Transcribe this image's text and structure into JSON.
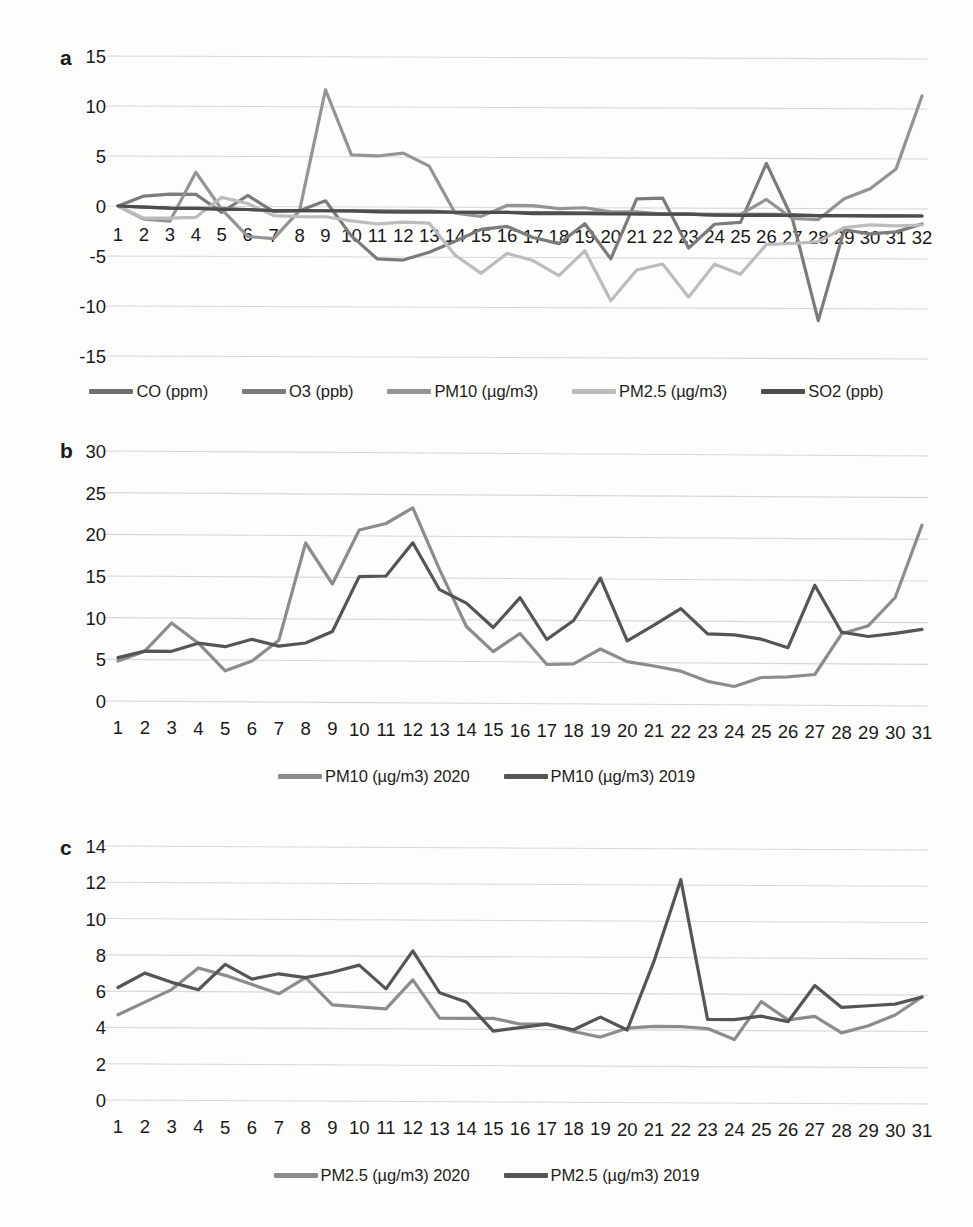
{
  "figure": {
    "panels": [
      "a",
      "b",
      "c"
    ],
    "background": "#fdfdfc"
  },
  "colors": {
    "co": "#6e6e6e",
    "o3": "#7b7b7b",
    "pm10": "#949494",
    "pm25": "#bcbcbc",
    "so2": "#4d4d4d",
    "series_2020": "#8c8c8c",
    "series_2019": "#555555",
    "grid": "#d8d8d8",
    "text": "#1d1d1d"
  },
  "panel_a": {
    "letter": "a",
    "ylabels": [
      "15",
      "10",
      "5",
      "0",
      "-5",
      "-10",
      "-15"
    ],
    "xlabels": [
      "1",
      "2",
      "3",
      "4",
      "5",
      "6",
      "7",
      "8",
      "9",
      "10",
      "11",
      "12",
      "13",
      "14",
      "15",
      "16",
      "17",
      "18",
      "19",
      "20",
      "21",
      "22",
      "23",
      "24",
      "25",
      "26",
      "27",
      "28",
      "29",
      "30",
      "31",
      "32"
    ],
    "legend": [
      {
        "label": "CO (ppm)",
        "color_key": "co"
      },
      {
        "label": "O3 (ppb)",
        "color_key": "o3"
      },
      {
        "label": "PM10 (µg/m3)",
        "color_key": "pm10"
      },
      {
        "label": "PM2.5 (µg/m3)",
        "color_key": "pm25"
      },
      {
        "label": "SO2 (ppb)",
        "color_key": "so2"
      }
    ]
  },
  "panel_b": {
    "letter": "b",
    "ylabels": [
      "30",
      "25",
      "20",
      "15",
      "10",
      "5",
      "0"
    ],
    "xlabels": [
      "1",
      "2",
      "3",
      "4",
      "5",
      "6",
      "7",
      "8",
      "9",
      "10",
      "11",
      "12",
      "13",
      "14",
      "15",
      "16",
      "17",
      "18",
      "19",
      "20",
      "21",
      "22",
      "23",
      "24",
      "25",
      "26",
      "27",
      "28",
      "29",
      "30",
      "31"
    ],
    "legend": [
      {
        "label": "PM10 (µg/m3) 2020",
        "color_key": "series_2020"
      },
      {
        "label": "PM10 (µg/m3) 2019",
        "color_key": "series_2019"
      }
    ]
  },
  "panel_c": {
    "letter": "c",
    "ylabels": [
      "14",
      "12",
      "10",
      "8",
      "6",
      "4",
      "2",
      "0"
    ],
    "xlabels": [
      "1",
      "2",
      "3",
      "4",
      "5",
      "6",
      "7",
      "8",
      "9",
      "10",
      "11",
      "12",
      "13",
      "14",
      "15",
      "16",
      "17",
      "18",
      "19",
      "20",
      "21",
      "22",
      "23",
      "24",
      "25",
      "26",
      "27",
      "28",
      "29",
      "30",
      "31"
    ],
    "legend": [
      {
        "label": "PM2.5 (µg/m3) 2020",
        "color_key": "series_2020"
      },
      {
        "label": "PM2.5 (µg/m3) 2019",
        "color_key": "series_2019"
      }
    ]
  },
  "chart_data": [
    {
      "panel": "a",
      "type": "line",
      "title": "",
      "xlabel": "",
      "ylabel": "",
      "ylim": [
        -15,
        15
      ],
      "yticks": [
        15,
        10,
        5,
        0,
        -5,
        -10,
        -15
      ],
      "grid": true,
      "legend_position": "bottom",
      "x": [
        1,
        2,
        3,
        4,
        5,
        6,
        7,
        8,
        9,
        10,
        11,
        12,
        13,
        14,
        15,
        16,
        17,
        18,
        19,
        20,
        21,
        22,
        23,
        24,
        25,
        26,
        27,
        28,
        29,
        30,
        31,
        32
      ],
      "series": [
        {
          "name": "CO (ppm)",
          "color": "#6e6e6e",
          "values": [
            0,
            -0.1,
            -0.2,
            -0.2,
            -0.2,
            -0.3,
            -0.4,
            -0.4,
            -0.4,
            -0.4,
            -0.4,
            -0.4,
            -0.4,
            -0.5,
            -0.5,
            -0.5,
            -0.5,
            -0.5,
            -0.5,
            -0.5,
            -0.6,
            -0.6,
            -0.6,
            -0.6,
            -0.6,
            -0.6,
            -0.6,
            -0.7,
            -0.7,
            -0.7,
            -0.7,
            -0.7
          ]
        },
        {
          "name": "O3 (ppb)",
          "color": "#7b7b7b",
          "values": [
            0,
            1.0,
            1.2,
            1.2,
            -0.6,
            1.1,
            -0.5,
            -0.4,
            0.6,
            -2.9,
            -5.2,
            -5.3,
            -4.5,
            -3.4,
            -2.2,
            -1.9,
            -3.0,
            -3.6,
            -1.6,
            -5.1,
            0.9,
            1.0,
            -4.0,
            -1.6,
            -1.4,
            4.5,
            -1.0,
            -11.2,
            -2.1,
            -2.5,
            -2.3,
            -1.5
          ]
        },
        {
          "name": "PM10 (µg/m3)",
          "color": "#949494",
          "values": [
            0,
            -1.3,
            -1.5,
            3.4,
            -0.3,
            -3.0,
            -3.2,
            -0.4,
            11.7,
            5.2,
            5.1,
            5.4,
            4.1,
            -0.6,
            -0.9,
            0.2,
            0.2,
            -0.1,
            0.0,
            -0.4,
            -0.4,
            -0.6,
            -0.6,
            -0.7,
            -0.6,
            0.9,
            -1.0,
            -1.1,
            1.0,
            2.0,
            4.0,
            11.3
          ]
        },
        {
          "name": "PM2.5 (µg/m3)",
          "color": "#bcbcbc",
          "values": [
            0,
            -1.2,
            -1.2,
            -1.1,
            0.9,
            0.3,
            -0.9,
            -1.0,
            -1.0,
            -1.4,
            -1.7,
            -1.5,
            -1.6,
            -4.8,
            -6.6,
            -4.6,
            -5.3,
            -6.8,
            -4.3,
            -9.3,
            -6.2,
            -5.6,
            -8.9,
            -5.6,
            -6.6,
            -3.6,
            -3.5,
            -3.3,
            -1.9,
            -1.6,
            -1.7,
            -1.6
          ]
        },
        {
          "name": "SO2 (ppb)",
          "color": "#4d4d4d",
          "values": [
            0,
            -0.1,
            -0.2,
            -0.2,
            -0.3,
            -0.3,
            -0.4,
            -0.4,
            -0.4,
            -0.4,
            -0.5,
            -0.5,
            -0.5,
            -0.5,
            -0.5,
            -0.5,
            -0.6,
            -0.6,
            -0.6,
            -0.6,
            -0.6,
            -0.6,
            -0.6,
            -0.7,
            -0.7,
            -0.7,
            -0.7,
            -0.7,
            -0.7,
            -0.7,
            -0.7,
            -0.7
          ]
        }
      ]
    },
    {
      "panel": "b",
      "type": "line",
      "title": "",
      "xlabel": "",
      "ylabel": "",
      "ylim": [
        0,
        30
      ],
      "yticks": [
        0,
        5,
        10,
        15,
        20,
        25,
        30
      ],
      "grid": true,
      "legend_position": "bottom",
      "x": [
        1,
        2,
        3,
        4,
        5,
        6,
        7,
        8,
        9,
        10,
        11,
        12,
        13,
        14,
        15,
        16,
        17,
        18,
        19,
        20,
        21,
        22,
        23,
        24,
        25,
        26,
        27,
        28,
        29,
        30,
        31
      ],
      "series": [
        {
          "name": "PM10 (µg/m3) 2020",
          "color": "#8c8c8c",
          "values": [
            4.8,
            6.0,
            9.4,
            7.0,
            3.7,
            4.9,
            7.4,
            19.1,
            14.2,
            20.7,
            21.5,
            23.4,
            16.0,
            9.2,
            6.2,
            8.4,
            4.7,
            4.8,
            6.6,
            5.1,
            4.6,
            4.0,
            2.8,
            2.2,
            3.3,
            3.4,
            3.7,
            8.6,
            9.6,
            13.0,
            21.7
          ]
        },
        {
          "name": "PM10 (µg/m3) 2019",
          "color": "#555555",
          "values": [
            5.2,
            6.0,
            6.0,
            7.0,
            6.6,
            7.5,
            6.7,
            7.1,
            8.5,
            15.1,
            15.2,
            19.2,
            13.6,
            12.0,
            9.1,
            12.7,
            7.7,
            10.0,
            15.1,
            7.6,
            9.5,
            11.5,
            8.5,
            8.4,
            7.9,
            6.9,
            14.4,
            8.8,
            8.3,
            8.7,
            9.2
          ]
        }
      ]
    },
    {
      "panel": "c",
      "type": "line",
      "title": "",
      "xlabel": "",
      "ylabel": "",
      "ylim": [
        0,
        14
      ],
      "yticks": [
        0,
        2,
        4,
        6,
        8,
        10,
        12,
        14
      ],
      "grid": true,
      "legend_position": "bottom",
      "x": [
        1,
        2,
        3,
        4,
        5,
        6,
        7,
        8,
        9,
        10,
        11,
        12,
        13,
        14,
        15,
        16,
        17,
        18,
        19,
        20,
        21,
        22,
        23,
        24,
        25,
        26,
        27,
        28,
        29,
        30,
        31
      ],
      "series": [
        {
          "name": "PM2.5 (µg/m3) 2020",
          "color": "#8c8c8c",
          "values": [
            4.7,
            5.4,
            6.1,
            7.3,
            6.9,
            6.4,
            5.9,
            6.8,
            5.3,
            5.2,
            5.1,
            6.7,
            4.6,
            4.6,
            4.6,
            4.3,
            4.3,
            3.9,
            3.6,
            4.1,
            4.2,
            4.2,
            4.1,
            3.5,
            5.6,
            4.6,
            4.8,
            3.9,
            4.3,
            4.9,
            5.9
          ]
        },
        {
          "name": "PM2.5 (µg/m3) 2019",
          "color": "#555555",
          "values": [
            6.2,
            7.0,
            6.5,
            6.1,
            7.5,
            6.7,
            7.0,
            6.8,
            7.1,
            7.5,
            6.2,
            8.3,
            6.0,
            5.5,
            3.9,
            4.1,
            4.3,
            4.0,
            4.7,
            4.0,
            7.8,
            12.3,
            4.6,
            4.6,
            4.8,
            4.5,
            6.5,
            5.3,
            5.4,
            5.5,
            5.9
          ]
        }
      ]
    }
  ]
}
